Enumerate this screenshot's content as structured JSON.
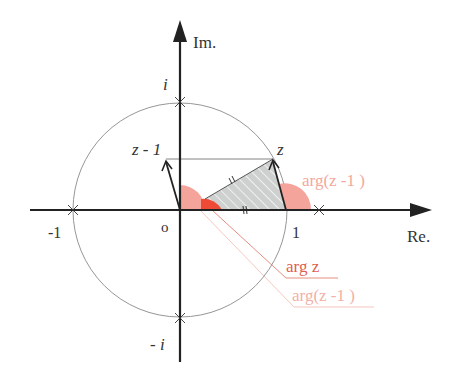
{
  "diagram": {
    "axes": {
      "real_label": "Re.",
      "imag_label": "Im."
    },
    "origin_label": "o",
    "points": {
      "one": "1",
      "minus_one": "-1",
      "i": "i",
      "minus_i": "- i",
      "z": "z",
      "z_minus_1": "z - 1"
    },
    "annotations": {
      "arg_z_minus_1_top": "arg(z -1 )",
      "arg_z": "arg z",
      "arg_z_minus_1_bottom": "arg(z -1 )"
    },
    "colors": {
      "axis": "#222222",
      "circle": "#888888",
      "angle_light": "#f4a49a",
      "angle_strong": "#ee4a36",
      "shaded": "#cdd0ce",
      "annotation_strong": "#e0705f",
      "annotation_light": "#f3b8ae"
    }
  }
}
